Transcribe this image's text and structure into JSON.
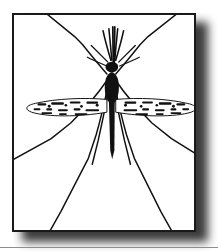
{
  "figure": {
    "subject": "mosquito",
    "style": "black-and-white line engraving",
    "alt_text": "Line drawing of a mosquito viewed from above, wings outstretched horizontally, six long legs splayed to the frame edges",
    "frame": {
      "border_color": "#1a1a1a",
      "border_width_px": 2,
      "background_color": "#ffffff",
      "shadow_color": "#2b2b2b",
      "x": 12,
      "y": 13,
      "width": 184,
      "height": 219
    },
    "page_rule": {
      "color": "#8d8d8d",
      "y": 247
    },
    "ink_color": "#111111",
    "parts": [
      {
        "name": "head",
        "label": "head"
      },
      {
        "name": "antennae",
        "label": "antennae"
      },
      {
        "name": "proboscis",
        "label": "proboscis"
      },
      {
        "name": "thorax",
        "label": "thorax"
      },
      {
        "name": "abdomen",
        "label": "abdomen"
      },
      {
        "name": "wing-left",
        "label": "left wing"
      },
      {
        "name": "wing-right",
        "label": "right wing"
      },
      {
        "name": "legs",
        "label": "legs"
      }
    ]
  },
  "geometry": {
    "body_axis_x": 110,
    "head_center_y": 64,
    "thorax_top_y": 70,
    "abdomen_bottom_y": 158,
    "wing_axis_y": 100,
    "wing_left_tip_x": 30,
    "wing_right_tip_x": 192
  }
}
